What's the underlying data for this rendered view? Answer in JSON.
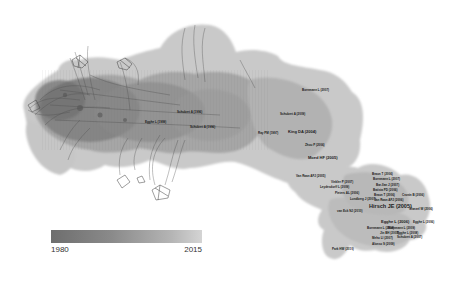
{
  "figure": {
    "type": "citation-network-cluster-map"
  },
  "colors": {
    "halo_light": "#c8c8c8",
    "halo_mid": "#b0b0b0",
    "halo_dark": "#9a9a9a",
    "edges": "#555555",
    "label_text": "#1a1a1a",
    "legend_start": "#6e6e6e",
    "legend_end": "#d4d4d4"
  },
  "legend": {
    "min_label": "1980",
    "max_label": "2015"
  },
  "labels": [
    {
      "text": "Egghe L (1999)",
      "x": 145,
      "y": 121,
      "size": "small"
    },
    {
      "text": "Schubert A (1996)",
      "x": 177,
      "y": 111,
      "size": "small"
    },
    {
      "text": "Schubert A (1996)",
      "x": 190,
      "y": 126,
      "size": "small"
    },
    {
      "text": "Ray PM (1997)",
      "x": 258,
      "y": 132,
      "size": "small"
    },
    {
      "text": "Bornmann L (2007)",
      "x": 302,
      "y": 89,
      "size": "small"
    },
    {
      "text": "Schubert A (2009)",
      "x": 280,
      "y": 113,
      "size": "small"
    },
    {
      "text": "King DA (2004)",
      "x": 288,
      "y": 132,
      "size": "medium"
    },
    {
      "text": "Zhou P (2006)",
      "x": 305,
      "y": 144,
      "size": "small"
    },
    {
      "text": "Moed HF (2005)",
      "x": 308,
      "y": 157,
      "size": "medium"
    },
    {
      "text": "Van Raan AFJ (2005)",
      "x": 296,
      "y": 175,
      "size": "small"
    },
    {
      "text": "Vinkler P (2007)",
      "x": 331,
      "y": 182,
      "size": "small"
    },
    {
      "text": "Leydesdorff L (2009)",
      "x": 320,
      "y": 186,
      "size": "small"
    },
    {
      "text": "Pieters AL (2006)",
      "x": 335,
      "y": 192,
      "size": "small"
    },
    {
      "text": "Lundberg J (2007)",
      "x": 350,
      "y": 198,
      "size": "small"
    },
    {
      "text": "van Eck NJ (2010)",
      "x": 337,
      "y": 210,
      "size": "small"
    },
    {
      "text": "Braun T (2006)",
      "x": 372,
      "y": 173,
      "size": "small"
    },
    {
      "text": "Bornmann L (2007)",
      "x": 373,
      "y": 178,
      "size": "small"
    },
    {
      "text": "Bar-Ilan J (2007)",
      "x": 376,
      "y": 184,
      "size": "small"
    },
    {
      "text": "Batista PD (2006)",
      "x": 373,
      "y": 189,
      "size": "small"
    },
    {
      "text": "Braun T (2006)",
      "x": 374,
      "y": 194,
      "size": "small"
    },
    {
      "text": "Cronin B (2006)",
      "x": 402,
      "y": 194,
      "size": "small"
    },
    {
      "text": "Van Raan AFJ (2006)",
      "x": 374,
      "y": 199,
      "size": "small"
    },
    {
      "text": "Hirsch JE (2005)",
      "x": 369,
      "y": 206,
      "size": "large"
    },
    {
      "text": "Glanzel W (2006)",
      "x": 409,
      "y": 208,
      "size": "small"
    },
    {
      "text": "Egghe L (2006)",
      "x": 381,
      "y": 222,
      "size": "medium"
    },
    {
      "text": "Egghe L (2006)",
      "x": 413,
      "y": 222,
      "size": "small"
    },
    {
      "text": "Bornmann L (2008)",
      "x": 367,
      "y": 227,
      "size": "small"
    },
    {
      "text": "Bornmann L (2009)",
      "x": 388,
      "y": 227,
      "size": "small"
    },
    {
      "text": "Jin BH (2007)",
      "x": 380,
      "y": 232,
      "size": "small"
    },
    {
      "text": "Egghe L (2008)",
      "x": 397,
      "y": 232,
      "size": "small"
    },
    {
      "text": "Meho LI (2007)",
      "x": 372,
      "y": 237,
      "size": "small"
    },
    {
      "text": "Schubert A (2007)",
      "x": 397,
      "y": 236,
      "size": "small"
    },
    {
      "text": "Alonso S (2009)",
      "x": 372,
      "y": 243,
      "size": "small"
    },
    {
      "text": "Park HW (2010)",
      "x": 332,
      "y": 248,
      "size": "small"
    }
  ]
}
